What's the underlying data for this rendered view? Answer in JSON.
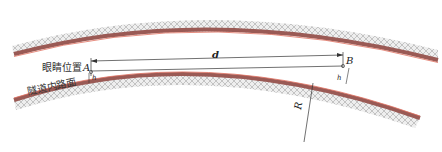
{
  "diagram": {
    "title": "",
    "labels": {
      "eye_position": "眼睛位置",
      "road_surface": "隧道内路面",
      "point_a": "A",
      "point_b": "B",
      "distance": "d",
      "radius": "R",
      "height_a": "h",
      "height_b": "h"
    },
    "colors": {
      "wall_hatch": "#c8c8c8",
      "wall_band": "#9a5a55",
      "wall_edge": "#e07060",
      "line": "#333333",
      "background": "#ffffff"
    }
  }
}
